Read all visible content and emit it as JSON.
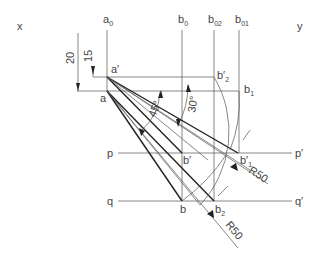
{
  "diagram": {
    "axis_labels": {
      "x": "x",
      "y": "y"
    },
    "vertical_lines": {
      "a0": {
        "base": "a",
        "sub": "0"
      },
      "b0": {
        "base": "b",
        "sub": "0"
      },
      "b02": {
        "base": "b",
        "sub": "02"
      },
      "b01": {
        "base": "b",
        "sub": "01"
      }
    },
    "points": {
      "a_prime": "a′",
      "a": "a",
      "b2_prime": {
        "base": "b′",
        "sub": "2"
      },
      "b1": {
        "base": "b",
        "sub": "1"
      },
      "b_prime": "b′",
      "b1_prime": {
        "base": "b′",
        "sub": "1"
      },
      "b": "b",
      "b2": {
        "base": "b",
        "sub": "2"
      }
    },
    "lines": {
      "p": "p",
      "p_prime": "p′",
      "q": "q",
      "q_prime": "q′"
    },
    "dimensions": {
      "d20": "20",
      "d15": "15",
      "angle45": "45°",
      "angle30": "30°",
      "r50_upper": "R50",
      "r50_lower": "R50"
    }
  }
}
